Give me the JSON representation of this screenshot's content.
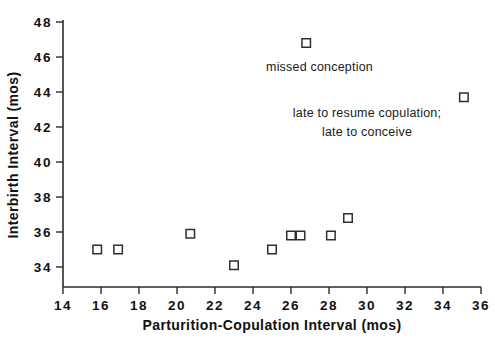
{
  "chart_data": {
    "type": "scatter",
    "title": "",
    "xlabel": "Parturition-Copulation  Interval   (mos)",
    "ylabel": "Interbirth  Interval   (mos)",
    "xlim": [
      14,
      36
    ],
    "ylim": [
      33,
      48
    ],
    "xticks": [
      14,
      16,
      18,
      20,
      22,
      24,
      26,
      28,
      30,
      32,
      34,
      36
    ],
    "yticks": [
      34,
      36,
      38,
      40,
      42,
      44,
      46,
      48
    ],
    "xticklabels": [
      "14",
      "16",
      "18",
      "20",
      "22",
      "24",
      "26",
      "28",
      "30",
      "32",
      "34",
      "36"
    ],
    "yticklabels": [
      "34",
      "36",
      "38",
      "40",
      "42",
      "44",
      "46",
      "48"
    ],
    "grid": false,
    "legend": null,
    "marker_style": "open-square",
    "points": [
      {
        "x": 15.8,
        "y": 35.0
      },
      {
        "x": 16.9,
        "y": 35.0
      },
      {
        "x": 20.7,
        "y": 35.9
      },
      {
        "x": 23.0,
        "y": 34.1
      },
      {
        "x": 25.0,
        "y": 35.0
      },
      {
        "x": 26.0,
        "y": 35.8
      },
      {
        "x": 26.5,
        "y": 35.8
      },
      {
        "x": 26.8,
        "y": 46.8
      },
      {
        "x": 28.1,
        "y": 35.8
      },
      {
        "x": 29.0,
        "y": 36.8
      },
      {
        "x": 35.1,
        "y": 43.7
      }
    ],
    "annotations": [
      {
        "text": "missed conception",
        "x": 27.5,
        "y": 45.2
      },
      {
        "text": "late to resume copulation;",
        "x": 30.0,
        "y": 42.6
      },
      {
        "text": "late to conceive",
        "x": 30.0,
        "y": 41.5
      }
    ]
  },
  "colors": {
    "background": "#ffffff",
    "axis": "#2b2b2b",
    "marker_stroke": "#2f2f2f",
    "marker_fill": "#ffffff",
    "text": "#111111"
  }
}
